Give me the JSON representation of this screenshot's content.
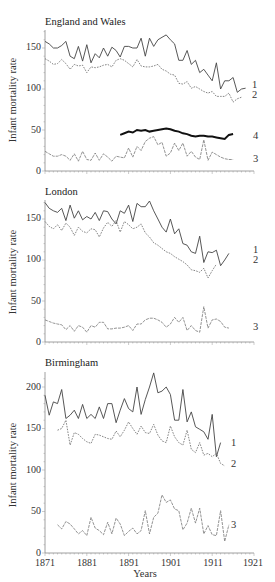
{
  "figure": {
    "x_axis_label": "Years",
    "y_axis_label": "Infant mortality rate"
  },
  "chart_data": [
    {
      "type": "line",
      "title": "England and Wales",
      "xlabel": "",
      "ylabel": "Infant mortality rate",
      "xlim": [
        1871,
        1921
      ],
      "ylim": [
        0,
        170
      ],
      "yticks": [
        0,
        50,
        100,
        150
      ],
      "grid": false,
      "legend_position": "inline-right",
      "series": [
        {
          "name": "1",
          "style": "solid",
          "start_year": 1871,
          "values": [
            158,
            155,
            150,
            150,
            153,
            158,
            140,
            137,
            152,
            134,
            154,
            132,
            143,
            138,
            150,
            140,
            151,
            147,
            139,
            152,
            152,
            150,
            150,
            162,
            140,
            162,
            152,
            160,
            163,
            166,
            160,
            155,
            135,
            135,
            147,
            130,
            135,
            120,
            124,
            117,
            110,
            132,
            100,
            110,
            110,
            114,
            96,
            100,
            101
          ]
        },
        {
          "name": "2",
          "style": "dotted",
          "start_year": 1871,
          "values": [
            137,
            134,
            130,
            131,
            136,
            131,
            124,
            130,
            128,
            129,
            120,
            127,
            126,
            127,
            129,
            130,
            127,
            135,
            137,
            135,
            131,
            127,
            136,
            128,
            127,
            127,
            128,
            130,
            124,
            122,
            118,
            117,
            107,
            106,
            109,
            101,
            103,
            100,
            97,
            95,
            97,
            91,
            91,
            91,
            95,
            84,
            88,
            90
          ]
        },
        {
          "name": "3",
          "style": "dashed",
          "start_year": 1871,
          "values": [
            24,
            21,
            18,
            18,
            20,
            18,
            13,
            21,
            12,
            24,
            14,
            13,
            22,
            13,
            21,
            17,
            12,
            18,
            17,
            16,
            28,
            17,
            30,
            25,
            36,
            40,
            42,
            32,
            35,
            18,
            22,
            34,
            25,
            34,
            18,
            24,
            17,
            14,
            38,
            13,
            23,
            20,
            17,
            15,
            14,
            14
          ]
        },
        {
          "name": "4",
          "style": "bold",
          "start_year": 1889,
          "values": [
            44,
            46,
            48,
            47,
            50,
            49,
            50,
            48,
            49,
            50,
            51,
            52,
            51,
            49,
            48,
            46,
            45,
            43,
            42,
            43,
            43,
            42,
            42,
            41,
            40,
            39,
            44,
            45
          ]
        }
      ]
    },
    {
      "type": "line",
      "title": "London",
      "xlabel": "",
      "ylabel": "Infant mortality rate",
      "xlim": [
        1871,
        1921
      ],
      "ylim": [
        0,
        170
      ],
      "yticks": [
        0,
        50,
        100,
        150
      ],
      "grid": false,
      "legend_position": "inline-right",
      "series": [
        {
          "name": "1",
          "style": "solid",
          "start_year": 1871,
          "values": [
            170,
            163,
            160,
            158,
            163,
            148,
            167,
            151,
            160,
            149,
            153,
            150,
            158,
            148,
            160,
            159,
            150,
            144,
            160,
            157,
            167,
            147,
            169,
            165,
            165,
            172,
            160,
            150,
            140,
            134,
            150,
            132,
            138,
            120,
            118,
            110,
            108,
            129,
            97,
            110,
            109,
            112,
            93,
            100,
            108
          ]
        },
        {
          "name": "2",
          "style": "dotted",
          "start_year": 1871,
          "values": [
            147,
            141,
            138,
            143,
            136,
            145,
            140,
            130,
            140,
            135,
            133,
            138,
            137,
            128,
            139,
            146,
            141,
            148,
            134,
            147,
            143,
            138,
            140,
            144,
            133,
            128,
            121,
            118,
            114,
            110,
            108,
            104,
            101,
            98,
            94,
            88,
            87,
            85,
            90,
            78,
            87,
            95
          ]
        },
        {
          "name": "3",
          "style": "dashed",
          "start_year": 1871,
          "values": [
            27,
            25,
            23,
            22,
            21,
            15,
            20,
            13,
            20,
            18,
            12,
            20,
            18,
            24,
            24,
            16,
            16,
            17,
            17,
            18,
            20,
            14,
            22,
            22,
            27,
            29,
            29,
            27,
            24,
            18,
            22,
            30,
            24,
            30,
            14,
            20,
            14,
            12,
            43,
            17,
            27,
            28,
            25,
            18,
            17
          ]
        }
      ]
    },
    {
      "type": "line",
      "title": "Birmingham",
      "xlabel": "Years",
      "ylabel": "Infant mortality rate",
      "xlim": [
        1871,
        1921
      ],
      "ylim": [
        0,
        220
      ],
      "xticks": [
        1871,
        1881,
        1891,
        1901,
        1911,
        1921
      ],
      "yticks": [
        0,
        50,
        100,
        150,
        200
      ],
      "grid": false,
      "legend_position": "inline-right",
      "series": [
        {
          "name": "1",
          "style": "solid",
          "start_year": 1871,
          "values": [
            190,
            166,
            182,
            180,
            197,
            162,
            166,
            172,
            162,
            179,
            162,
            167,
            162,
            176,
            162,
            180,
            180,
            157,
            172,
            186,
            174,
            170,
            200,
            167,
            185,
            200,
            217,
            193,
            195,
            200,
            191,
            160,
            160,
            197,
            158,
            170,
            152,
            149,
            146,
            137,
            167,
            116,
            133
          ]
        },
        {
          "name": "2",
          "style": "dotted",
          "start_year": 1874,
          "values": [
            148,
            150,
            160,
            130,
            145,
            143,
            138,
            134,
            132,
            143,
            142,
            140,
            138,
            137,
            147,
            140,
            148,
            158,
            150,
            143,
            153,
            145,
            144,
            155,
            142,
            135,
            133,
            153,
            140,
            133,
            130,
            148,
            125,
            121,
            133,
            118,
            120,
            116,
            120,
            108,
            105
          ]
        },
        {
          "name": "3",
          "style": "dashed",
          "start_year": 1874,
          "values": [
            34,
            29,
            38,
            35,
            29,
            23,
            27,
            21,
            43,
            30,
            27,
            22,
            37,
            23,
            42,
            35,
            21,
            26,
            30,
            23,
            27,
            51,
            23,
            43,
            48,
            70,
            61,
            64,
            53,
            51,
            28,
            36,
            54,
            36,
            54,
            23,
            33,
            22,
            21,
            51,
            14,
            34
          ]
        }
      ]
    }
  ],
  "panels": [
    {
      "title": "England and Wales",
      "y_ticks": [
        "0",
        "50",
        "100",
        "150"
      ],
      "series_labels": [
        "1",
        "2",
        "4",
        "3"
      ]
    },
    {
      "title": "London",
      "y_ticks": [
        "0",
        "50",
        "100",
        "150"
      ],
      "series_labels": [
        "1",
        "2",
        "3"
      ]
    },
    {
      "title": "Birmingham",
      "y_ticks": [
        "0",
        "50",
        "100",
        "150",
        "200"
      ],
      "series_labels": [
        "1",
        "2",
        "3"
      ]
    }
  ],
  "x_ticks": [
    "1871",
    "1881",
    "1891",
    "1901",
    "1911",
    "1921"
  ]
}
